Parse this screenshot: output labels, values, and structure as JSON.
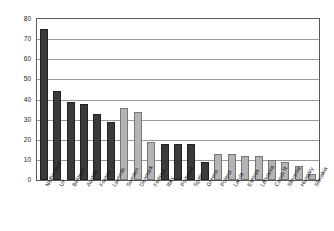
{
  "chart_data": {
    "type": "bar",
    "title": "",
    "subtitle": "",
    "xlabel": "",
    "ylabel": "",
    "ylim": [
      0,
      80
    ],
    "ytick_step": 10,
    "yticks": [
      "0",
      "10",
      "20",
      "30",
      "40",
      "50",
      "60",
      "70",
      "80"
    ],
    "grid": true,
    "legend": "none",
    "categories": [
      "Netherland",
      "UK",
      "Belgium",
      "Austria",
      "France",
      "Luxemb.",
      "Sweden",
      "Denmark",
      "Finland",
      "Italy",
      "Portugal",
      "Spain",
      "Greece",
      "Poland",
      "Latvia",
      "Estonia",
      "Lithuania",
      "Czech R.",
      "Slovenia",
      "Hungary",
      "Slovakia"
    ],
    "values": [
      75,
      44,
      39,
      38,
      33,
      29,
      36,
      34,
      19,
      18,
      18,
      18,
      9,
      13,
      13,
      12,
      12,
      10,
      9,
      7,
      3
    ],
    "series": [
      {
        "name": "share",
        "values": [
          75,
          44,
          39,
          38,
          33,
          29,
          36,
          34,
          19,
          18,
          18,
          18,
          9,
          13,
          13,
          12,
          12,
          10,
          9,
          7,
          3
        ]
      }
    ],
    "bar_styles": [
      "dark",
      "dark",
      "dark",
      "dark",
      "dark",
      "dark",
      "light",
      "light",
      "light",
      "dark",
      "dark",
      "dark",
      "dark",
      "light",
      "light",
      "light",
      "light",
      "light",
      "light",
      "light",
      "light"
    ],
    "colors": {
      "dark_bar": "#3a3a3a",
      "light_bar": "#b4b4b4",
      "gridline": "#9a9a9a",
      "axis": "#5a5a5a",
      "background": "#ffffff",
      "text": "#111111"
    }
  }
}
